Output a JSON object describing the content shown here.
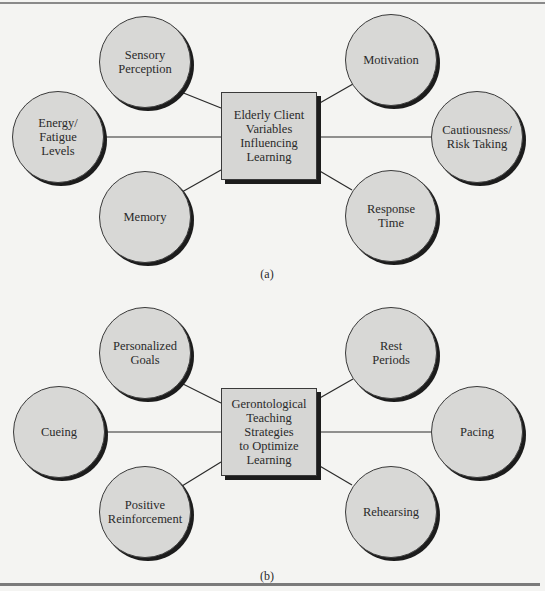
{
  "diagram_a": {
    "center": "Elderly Client\nVariables\nInfluencing\nLearning",
    "nodes": [
      "Sensory\nPerception",
      "Energy/\nFatigue\nLevels",
      "Memory",
      "Motivation",
      "Cautiousness/\nRisk Taking",
      "Response\nTime"
    ],
    "caption": "(a)"
  },
  "diagram_b": {
    "center": "Gerontological\nTeaching\nStrategies\nto Optimize\nLearning",
    "nodes": [
      "Personalized\nGoals",
      "Cueing",
      "Positive\nReinforcement",
      "Rest\nPeriods",
      "Pacing",
      "Rehearsing"
    ],
    "caption": "(b)"
  },
  "colors": {
    "background": "#f4f4f2",
    "node_fill": "#d8d8d6",
    "outline": "#3a3a3a",
    "shadow": "#1c1c1c"
  }
}
